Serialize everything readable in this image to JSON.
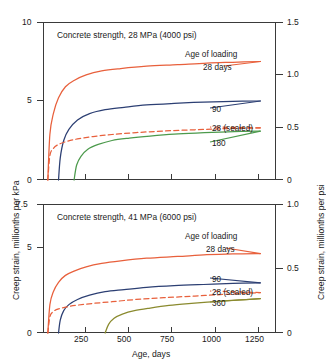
{
  "figure": {
    "xlabel": "Age, days",
    "ylabel_left": "Creep strain, millionths per kPa",
    "ylabel_right": "Creep strain, millionths per psi"
  },
  "chart_data": [
    {
      "type": "line",
      "title": "Concrete strength, 28 MPa (4000 psi)",
      "xlabel": "Age, days",
      "ylabel": "Creep strain, millionths per kPa",
      "ylabel_right": "Creep strain, millionths per psi",
      "xlim": [
        0,
        1350
      ],
      "ylim": [
        0,
        10
      ],
      "ylim_right": [
        0,
        1.5
      ],
      "xticks": [
        250,
        500,
        750,
        1000,
        1250
      ],
      "yticks": [
        0,
        5,
        10
      ],
      "yticks_right": [
        0,
        0.5,
        1.0,
        1.5
      ],
      "grid": false,
      "legend_position": "inside-right",
      "legend_title": "Age of loading",
      "series": [
        {
          "name": "28 days",
          "color": "#E8603C",
          "style": "solid",
          "x": [
            28,
            40,
            60,
            90,
            130,
            180,
            250,
            340,
            450,
            600,
            780,
            950,
            1100,
            1260
          ],
          "y": [
            0.0,
            2.9,
            4.2,
            5.2,
            5.9,
            6.3,
            6.65,
            6.9,
            7.05,
            7.2,
            7.3,
            7.4,
            7.45,
            7.5
          ]
        },
        {
          "name": "90",
          "color": "#2C3F73",
          "style": "solid",
          "x": [
            90,
            100,
            120,
            150,
            200,
            270,
            360,
            470,
            600,
            760,
            930,
            1100,
            1260
          ],
          "y": [
            0.0,
            1.4,
            2.5,
            3.2,
            3.8,
            4.2,
            4.45,
            4.6,
            4.75,
            4.85,
            4.93,
            4.98,
            5.0
          ]
        },
        {
          "name": "28 (sealed)",
          "color": "#E8603C",
          "style": "dashed",
          "x": [
            28,
            40,
            60,
            90,
            140,
            200,
            290,
            400,
            540,
            700,
            880,
            1060,
            1260
          ],
          "y": [
            0.0,
            1.55,
            2.0,
            2.25,
            2.45,
            2.6,
            2.75,
            2.88,
            3.0,
            3.1,
            3.18,
            3.25,
            3.3
          ]
        },
        {
          "name": "180",
          "color": "#4C9A4C",
          "style": "solid",
          "x": [
            180,
            195,
            220,
            260,
            320,
            400,
            500,
            620,
            760,
            910,
            1070,
            1260
          ],
          "y": [
            0.0,
            0.95,
            1.5,
            1.95,
            2.25,
            2.5,
            2.65,
            2.78,
            2.9,
            2.98,
            3.05,
            3.1
          ]
        }
      ]
    },
    {
      "type": "line",
      "title": "Concrete strength, 41 MPa (6000 psi)",
      "xlabel": "Age, days",
      "ylabel": "Creep strain, millionths per kPa",
      "ylabel_right": "Creep strain, millionths per psi",
      "xlim": [
        0,
        1350
      ],
      "ylim": [
        0,
        7.5
      ],
      "ylim_right": [
        0,
        1.0
      ],
      "xticks": [
        250,
        500,
        750,
        1000,
        1250
      ],
      "yticks": [
        0,
        5,
        7.5
      ],
      "yticks_right": [
        0,
        0.5,
        1.0
      ],
      "grid": false,
      "legend_position": "inside-right",
      "legend_title": "Age of loading",
      "series": [
        {
          "name": "28 days",
          "color": "#E8603C",
          "style": "solid",
          "x": [
            28,
            40,
            60,
            90,
            130,
            180,
            250,
            340,
            450,
            600,
            780,
            950,
            1100,
            1260
          ],
          "y": [
            0.0,
            1.65,
            2.4,
            2.95,
            3.35,
            3.6,
            3.85,
            4.05,
            4.2,
            4.35,
            4.45,
            4.55,
            4.6,
            4.62
          ]
        },
        {
          "name": "90",
          "color": "#2C3F73",
          "style": "solid",
          "x": [
            90,
            100,
            120,
            150,
            200,
            270,
            360,
            470,
            600,
            760,
            930,
            1100,
            1260
          ],
          "y": [
            0.0,
            0.75,
            1.3,
            1.65,
            1.95,
            2.2,
            2.4,
            2.52,
            2.65,
            2.75,
            2.82,
            2.88,
            2.92
          ]
        },
        {
          "name": "28 (sealed)",
          "color": "#E8603C",
          "style": "dashed",
          "x": [
            28,
            40,
            60,
            90,
            140,
            200,
            290,
            400,
            540,
            700,
            880,
            1060,
            1260
          ],
          "y": [
            0.0,
            0.95,
            1.25,
            1.4,
            1.52,
            1.62,
            1.72,
            1.82,
            1.95,
            2.05,
            2.15,
            2.25,
            2.35
          ]
        },
        {
          "name": "360",
          "color": "#8A8A2E",
          "style": "solid",
          "x": [
            360,
            380,
            410,
            460,
            530,
            620,
            730,
            860,
            1000,
            1140,
            1260
          ],
          "y": [
            0.0,
            0.5,
            0.85,
            1.1,
            1.3,
            1.45,
            1.6,
            1.72,
            1.83,
            1.92,
            2.0
          ]
        }
      ]
    }
  ],
  "legend_top": {
    "title": "Age of loading",
    "items": [
      {
        "label": "28 days"
      },
      {
        "label": "90"
      },
      {
        "label": "28 (sealed)"
      },
      {
        "label": "180"
      }
    ]
  },
  "legend_bottom": {
    "title": "Age of loading",
    "items": [
      {
        "label": "28 days"
      },
      {
        "label": "90"
      },
      {
        "label": "28 (sealed)"
      },
      {
        "label": "360"
      }
    ]
  },
  "ticklabels": {
    "top_left": [
      "0",
      "5",
      "10"
    ],
    "top_right": [
      "0",
      "0.5",
      "1.0",
      "1.5"
    ],
    "bottom_left": [
      "0",
      "5",
      "7.5"
    ],
    "bottom_right": [
      "0",
      "0.5",
      "1.0"
    ],
    "x": [
      "250",
      "500",
      "750",
      "1000",
      "1250"
    ]
  }
}
